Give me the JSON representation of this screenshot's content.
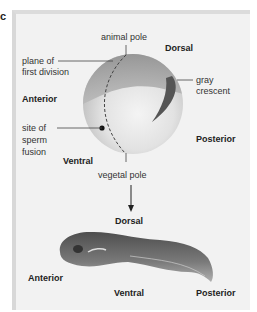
{
  "figure": {
    "part_label": "c",
    "egg": {
      "labels": {
        "top_pole": "animal pole",
        "bottom_pole": "vegetal pole",
        "plane": "plane of\nfirst division",
        "plane_line1": "plane of",
        "plane_line2": "first division",
        "crescent_line1": "gray",
        "crescent_line2": "crescent",
        "sperm_line1": "site of",
        "sperm_line2": "sperm",
        "sperm_line3": "fusion",
        "dorsal": "Dorsal",
        "ventral": "Ventral",
        "anterior": "Anterior",
        "posterior": "Posterior"
      }
    },
    "tadpole": {
      "labels": {
        "dorsal": "Dorsal",
        "ventral": "Ventral",
        "anterior": "Anterior",
        "posterior": "Posterior"
      }
    },
    "colors": {
      "panel_bg": "#f2f2f2",
      "egg_light": "#e6e6e6",
      "egg_dark": "#8a8a8a",
      "crescent": "#555555",
      "tadpole": "#6a6a6a",
      "text": "#333333"
    }
  }
}
